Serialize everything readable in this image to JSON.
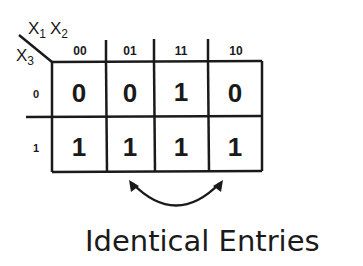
{
  "kmap": {
    "row_variable": {
      "base": "X",
      "sub": "3"
    },
    "col_variables": [
      {
        "base": "X",
        "sub": "1"
      },
      {
        "base": "X",
        "sub": "2"
      }
    ],
    "col_headers": [
      "00",
      "01",
      "11",
      "10"
    ],
    "row_headers": [
      "0",
      "1"
    ],
    "cells": [
      [
        "0",
        "0",
        "1",
        "0"
      ],
      [
        "1",
        "1",
        "1",
        "1"
      ]
    ]
  },
  "annotation": {
    "arrow": "double-headed curved arrow between columns 01 and 10 of row 1",
    "caption": "Identical Entries"
  }
}
